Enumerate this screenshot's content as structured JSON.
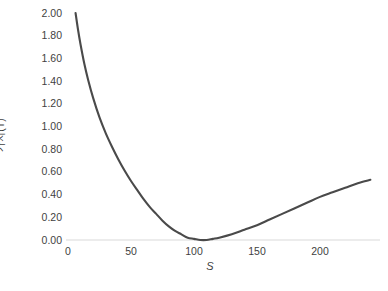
{
  "chart_data": {
    "type": "line",
    "title": "",
    "subtitle": "",
    "xlabel": "S",
    "ylabel": "가치(T)",
    "xlim": [
      0,
      240
    ],
    "ylim": [
      0.0,
      2.0
    ],
    "grid": false,
    "legend": null,
    "legend_position": "none",
    "line_color": "#4a4a4a",
    "axis_color": "#d9d9d9",
    "text_color": "#3f3f3f",
    "xticks": [
      {
        "value": 0,
        "label": "0"
      },
      {
        "value": 50,
        "label": "50"
      },
      {
        "value": 100,
        "label": "100"
      },
      {
        "value": 150,
        "label": "150"
      },
      {
        "value": 200,
        "label": "200"
      }
    ],
    "yticks": [
      {
        "value": 0.0,
        "label": "0.00"
      },
      {
        "value": 0.2,
        "label": "0.20"
      },
      {
        "value": 0.4,
        "label": "0.40"
      },
      {
        "value": 0.6,
        "label": "0.60"
      },
      {
        "value": 0.8,
        "label": "0.80"
      },
      {
        "value": 1.0,
        "label": "1.00"
      },
      {
        "value": 1.2,
        "label": "1.20"
      },
      {
        "value": 1.4,
        "label": "1.40"
      },
      {
        "value": 1.6,
        "label": "1.60"
      },
      {
        "value": 1.8,
        "label": "1.80"
      },
      {
        "value": 2.0,
        "label": "2.00"
      }
    ],
    "series": [
      {
        "name": "가치(T)",
        "color": "#4a4a4a",
        "x": [
          6,
          8,
          10,
          13,
          16,
          20,
          25,
          30,
          35,
          40,
          45,
          50,
          55,
          60,
          65,
          70,
          75,
          80,
          85,
          90,
          95,
          100,
          105,
          110,
          115,
          120,
          130,
          140,
          150,
          160,
          170,
          180,
          190,
          200,
          210,
          220,
          230,
          240
        ],
        "y": [
          2.0,
          1.85,
          1.72,
          1.55,
          1.41,
          1.25,
          1.08,
          0.94,
          0.82,
          0.71,
          0.61,
          0.52,
          0.44,
          0.36,
          0.29,
          0.23,
          0.17,
          0.12,
          0.08,
          0.05,
          0.02,
          0.01,
          0.0,
          0.0,
          0.01,
          0.02,
          0.05,
          0.09,
          0.13,
          0.18,
          0.23,
          0.28,
          0.33,
          0.38,
          0.42,
          0.46,
          0.5,
          0.53
        ]
      }
    ]
  }
}
